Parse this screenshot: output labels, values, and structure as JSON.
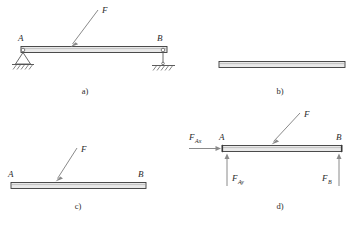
{
  "figure": {
    "panels": [
      {
        "id": "a",
        "caption": "a)",
        "left_label": "A",
        "right_label": "B",
        "force_label": "F",
        "left_support": "pinned-support",
        "right_support": "roller-support",
        "ground_hatching": true
      },
      {
        "id": "b",
        "caption": "b)",
        "left_label": "",
        "right_label": "",
        "force_label": "",
        "left_support": "none",
        "right_support": "none",
        "ground_hatching": false
      },
      {
        "id": "c",
        "caption": "c)",
        "left_label": "A",
        "right_label": "B",
        "force_label": "F",
        "left_support": "none",
        "right_support": "none",
        "ground_hatching": false
      },
      {
        "id": "d",
        "caption": "d)",
        "left_label": "A",
        "right_label": "B",
        "force_label": "F",
        "left_support": "none",
        "right_support": "none",
        "ground_hatching": false,
        "reactions": [
          {
            "name": "F_Ax",
            "base": "F",
            "sub": "Ax",
            "direction": "right",
            "at": "A"
          },
          {
            "name": "F_Ay",
            "base": "F",
            "sub": "Ay",
            "direction": "up",
            "at": "A"
          },
          {
            "name": "F_B",
            "base": "F",
            "sub": "B",
            "direction": "up",
            "at": "B"
          }
        ]
      }
    ],
    "colors": {
      "beam_fill": "#e9e9e9",
      "beam_stroke": "#3a3a3a",
      "arrow": "#8a8a8a",
      "support": "#5a5a5a",
      "text": "#2b2b2b",
      "background": "#ffffff"
    }
  }
}
